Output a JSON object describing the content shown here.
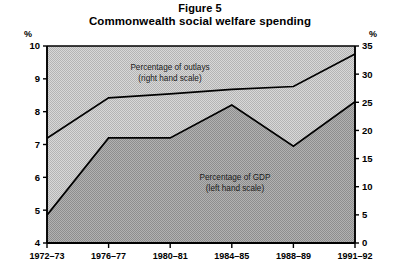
{
  "figure": {
    "label": "Figure 5",
    "title": "Commonwealth social welfare spending"
  },
  "axes": {
    "left_unit": "%",
    "right_unit": "%",
    "left_ticks": [
      "10",
      "9",
      "8",
      "7",
      "6",
      "5",
      "4"
    ],
    "right_ticks": [
      "35",
      "30",
      "25",
      "20",
      "15",
      "10",
      "5",
      "0"
    ],
    "x_ticks": [
      "1972–73",
      "1976–77",
      "1980–81",
      "1984–85",
      "1988–89",
      "1991–92"
    ]
  },
  "annotations": {
    "outlays_line1": "Percentage of outlays",
    "outlays_line2": "(right hand scale)",
    "gdp_line1": "Percentage of GDP",
    "gdp_line2": "(left hand scale)"
  },
  "colors": {
    "band_upper": "#c9c9c9",
    "band_lower": "#a3a3a3",
    "line": "#000000",
    "axis": "#000000",
    "page_background": "#ffffff"
  },
  "chart_data": {
    "type": "area",
    "title": "Commonwealth social welfare spending",
    "subtitle": "Figure 5",
    "xlabel": "",
    "ylabel": "%",
    "categories": [
      "1972–73",
      "1976–77",
      "1980–81",
      "1984–85",
      "1988–89",
      "1991–92"
    ],
    "grid": false,
    "legend": "inline-annotations",
    "left_axis": {
      "label": "%",
      "ylim": [
        4,
        10
      ],
      "ticks": [
        4,
        5,
        6,
        7,
        8,
        9,
        10
      ],
      "applies_to": "Percentage of GDP"
    },
    "right_axis": {
      "label": "%",
      "ylim": [
        0,
        35
      ],
      "ticks": [
        0,
        5,
        10,
        15,
        20,
        25,
        30,
        35
      ],
      "applies_to": "Percentage of outlays"
    },
    "series": [
      {
        "name": "Percentage of outlays (right hand scale)",
        "axis": "right",
        "values": [
          18.6,
          25.8,
          26.5,
          27.3,
          27.8,
          33.6
        ]
      },
      {
        "name": "Percentage of GDP (left hand scale)",
        "axis": "left",
        "values": [
          4.85,
          7.2,
          7.2,
          8.2,
          6.95,
          8.3
        ]
      }
    ]
  }
}
